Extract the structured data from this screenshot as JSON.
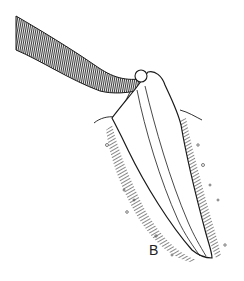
{
  "figure": {
    "panel_label": "B",
    "elements": [
      "ligature-band",
      "ball-clasp",
      "tooth",
      "root-canal",
      "gingiva",
      "alveolar-bone"
    ]
  },
  "colors": {
    "ink": "#1a1a1a",
    "hatch": "#444444",
    "background": "#ffffff"
  }
}
